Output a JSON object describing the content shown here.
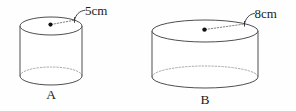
{
  "figure": {
    "type": "geometry-diagram",
    "background_color": "#fefefe",
    "stroke_color": "#3a3a3c",
    "hidden_edge_color": "#9a9a9e",
    "text_color": "#1b1b1b",
    "cylinders": [
      {
        "id": "A",
        "name_label": "A",
        "dimension_label": "5cm",
        "dimension_value": 5,
        "dimension_unit": "cm",
        "dimension_kind": "radius",
        "center_x": 51,
        "top_ellipse_cy": 26,
        "bottom_ellipse_cy": 76,
        "radius_x": 31,
        "radius_y": 9,
        "name_label_x": 51,
        "name_label_y": 99,
        "dim_label_x": 74,
        "dim_label_y": 13
      },
      {
        "id": "B",
        "name_label": "B",
        "dimension_label": "8cm",
        "dimension_value": 8,
        "dimension_unit": "cm",
        "dimension_kind": "radius",
        "center_x": 205,
        "top_ellipse_cy": 31,
        "bottom_ellipse_cy": 77,
        "radius_x": 53,
        "radius_y": 11,
        "name_label_x": 205,
        "name_label_y": 105,
        "dim_label_x": 238,
        "dim_label_y": 16
      }
    ]
  }
}
